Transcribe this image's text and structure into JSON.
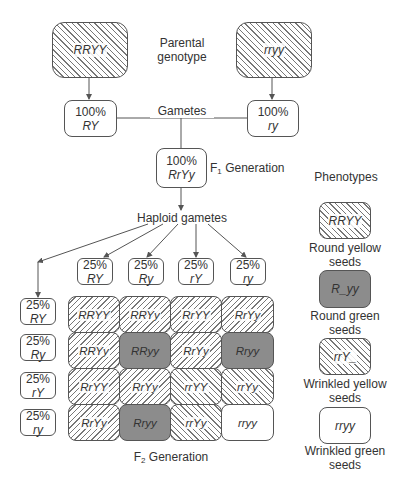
{
  "parental": {
    "label_line1": "Parental",
    "label_line2": "genotype",
    "left": "RRYY",
    "right": "rryy"
  },
  "gametes": {
    "label": "Gametes",
    "left": {
      "pct": "100%",
      "geno": "RY"
    },
    "right": {
      "pct": "100%",
      "geno": "ry"
    }
  },
  "f1": {
    "pct": "100%",
    "geno": "RrYy",
    "label_prefix": "F",
    "label_sub": "1",
    "label_suffix": " Generation"
  },
  "haploid": {
    "label": "Haploid gametes",
    "top": [
      {
        "pct": "25%",
        "geno": "RY"
      },
      {
        "pct": "25%",
        "geno": "Ry"
      },
      {
        "pct": "25%",
        "geno": "rY"
      },
      {
        "pct": "25%",
        "geno": "ry"
      }
    ],
    "left": [
      {
        "pct": "25%",
        "geno": "RY"
      },
      {
        "pct": "25%",
        "geno": "Ry"
      },
      {
        "pct": "25%",
        "geno": "rY"
      },
      {
        "pct": "25%",
        "geno": "ry"
      }
    ]
  },
  "f2": {
    "label_prefix": "F",
    "label_sub": "2",
    "label_suffix": " Generation",
    "grid": [
      [
        {
          "geno": "RRYY",
          "pheno": "round-yellow"
        },
        {
          "geno": "RRYy",
          "pheno": "round-yellow"
        },
        {
          "geno": "RrYY",
          "pheno": "round-yellow"
        },
        {
          "geno": "RrYy",
          "pheno": "round-yellow"
        }
      ],
      [
        {
          "geno": "RRYy",
          "pheno": "round-yellow"
        },
        {
          "geno": "RRyy",
          "pheno": "round-green"
        },
        {
          "geno": "RrYy",
          "pheno": "round-yellow"
        },
        {
          "geno": "Rryy",
          "pheno": "round-green"
        }
      ],
      [
        {
          "geno": "RrYY",
          "pheno": "round-yellow"
        },
        {
          "geno": "RrYy",
          "pheno": "round-yellow"
        },
        {
          "geno": "rrYY",
          "pheno": "wrinkled-yellow"
        },
        {
          "geno": "rrYy",
          "pheno": "wrinkled-yellow"
        }
      ],
      [
        {
          "geno": "RrYy",
          "pheno": "round-yellow"
        },
        {
          "geno": "Rryy",
          "pheno": "round-green"
        },
        {
          "geno": "rrYy",
          "pheno": "wrinkled-yellow"
        },
        {
          "geno": "rryy",
          "pheno": "wrinkled-green"
        }
      ]
    ]
  },
  "legend": {
    "title": "Phenotypes",
    "items": [
      {
        "geno": "RRYY",
        "line1": "Round yellow",
        "line2": "seeds",
        "fill": "backslash-hatch"
      },
      {
        "geno": "R_yy",
        "line1": "Round green",
        "line2": "seeds",
        "fill": "dark-gray"
      },
      {
        "geno": "rrY_",
        "line1": "Wrinkled yellow",
        "line2": "seeds",
        "fill": "backslash-hatch"
      },
      {
        "geno": "rryy",
        "line1": "Wrinkled green",
        "line2": "seeds",
        "fill": "white"
      }
    ]
  },
  "colors": {
    "line": "#555555",
    "hatch": "#777777",
    "dark_fill": "#8c8c8c",
    "text": "#333333"
  }
}
